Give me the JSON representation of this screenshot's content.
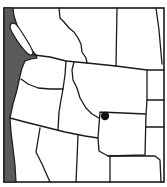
{
  "map": {
    "description": "Locator map of northwestern North America with a single point marker",
    "regions_shown": [
      "British Columbia",
      "Alberta",
      "Saskatchewan",
      "Manitoba",
      "Washington",
      "Oregon",
      "Idaho",
      "Montana",
      "Wyoming",
      "North Dakota",
      "South Dakota",
      "Nebraska",
      "California",
      "Nevada",
      "Utah",
      "Colorado"
    ],
    "colors": {
      "land": "#ffffff",
      "water": "#5a5a5a",
      "borders": "#1a1a1a",
      "marker": "#111111"
    },
    "marker": {
      "label": "Location marker",
      "region": "Wyoming (northwest corner)",
      "x": 105,
      "y": 116,
      "r": 4.2
    }
  }
}
